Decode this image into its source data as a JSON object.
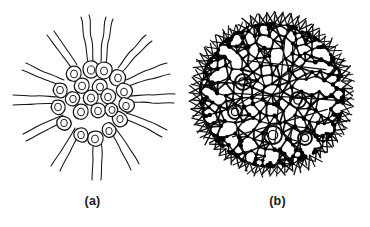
{
  "figure": {
    "kind": "scientific-illustration-plate",
    "background_color": "#ffffff",
    "ink_color": "#161616",
    "panel_count": 2
  },
  "panels": [
    {
      "id": "a",
      "caption": "(a)",
      "style": "pen-and-ink line drawing",
      "description": "Spherical colony drawn as an outline diagram: a cluster of pear-shaped cells, each bearing a pair of long wavy flagella radiating outward.",
      "cell_count_visible": 20,
      "flagella_per_cell": 2,
      "radiating_cell_count": 12,
      "interior_cell_count": 8,
      "center": {
        "x": 93,
        "y": 98
      },
      "cluster_radius": 36,
      "flagella_length": 58,
      "colors": {
        "outline": "#161616",
        "fill": "#ffffff"
      }
    },
    {
      "id": "b",
      "caption": "(b)",
      "style": "dense halftone photomicrograph rendering",
      "description": "Whole spherical Volvox colony shown as a triangulated network of cells joined by cytoplasmic strands, with short spines around the rim and several darker daughter colonies embedded inside.",
      "center": {
        "x": 87,
        "y": 95
      },
      "sphere_radius": 73,
      "spine_count": 64,
      "daughter_colony_count": 5,
      "daughter_colonies": [
        {
          "x": 58,
          "y": 82,
          "r": 8
        },
        {
          "x": 50,
          "y": 112,
          "r": 7
        },
        {
          "x": 113,
          "y": 100,
          "r": 8
        },
        {
          "x": 88,
          "y": 135,
          "r": 9
        },
        {
          "x": 120,
          "y": 138,
          "r": 7
        }
      ],
      "colors": {
        "mesh": "#131313",
        "node": "#000000",
        "fill": "#ffffff"
      }
    }
  ]
}
